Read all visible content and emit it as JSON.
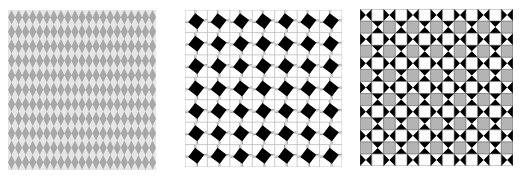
{
  "figure": {
    "background": "#ffffff",
    "panels": [
      {
        "id": "harlequin",
        "description": "Tessellation of gray diamonds (harlequin pattern)",
        "x": 8,
        "y": 10,
        "width": 148,
        "height": 160,
        "tile_w": 7.05,
        "tile_h": 14.5,
        "diamond_color": "#a8a8a8",
        "gap_color": "#e6e6e6",
        "columns": 21,
        "rows": 11
      },
      {
        "id": "diamond-grid",
        "description": "Black diamonds centered on a square grid with subdivision lines",
        "x": 185,
        "y": 10,
        "width": 157,
        "height": 157,
        "cells": 7,
        "diamond_color": "#000000",
        "grid_color": "#bdbdbd",
        "background": "#ffffff"
      },
      {
        "id": "bowtie-checker",
        "description": "Alternating bowtie (hourglass) tiles, white squares and gray squares",
        "x": 360,
        "y": 9,
        "width": 153,
        "height": 157,
        "columns": 13,
        "rows": 13,
        "black": "#000000",
        "white": "#ffffff",
        "gray": "#b4b4b4",
        "grid_color": "#555555"
      }
    ]
  }
}
